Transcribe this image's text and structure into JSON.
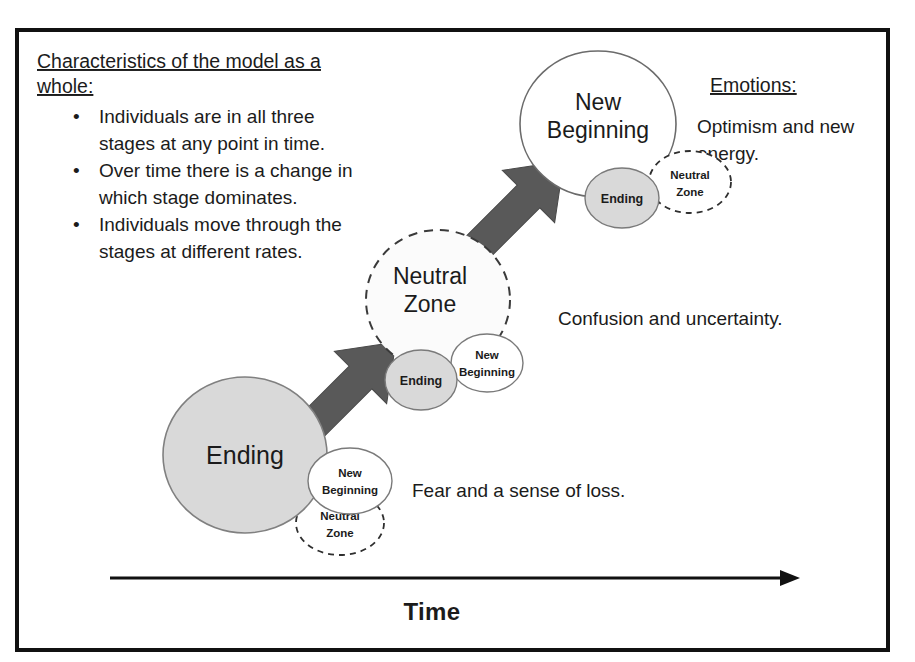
{
  "frame": {
    "border_color": "#111111",
    "background": "#ffffff"
  },
  "notes": {
    "heading_line1": "Characteristics of the model as a",
    "heading_line2": "whole:",
    "bullet_marker": "•",
    "bullets": [
      {
        "line1": "Individuals are in all three",
        "line2": "stages at any point in time."
      },
      {
        "line1": "Over time there is a change in",
        "line2": "which stage dominates."
      },
      {
        "line1": "Individuals move through the",
        "line2": "stages at different rates."
      }
    ]
  },
  "emotions": {
    "heading": "Emotions:",
    "items": [
      {
        "line1": "Optimism and new",
        "line2": "energy."
      },
      {
        "line1": "Confusion and uncertainty.",
        "line2": ""
      },
      {
        "line1": "Fear and a sense of loss.",
        "line2": ""
      }
    ]
  },
  "stages": [
    {
      "id": "stage-ending",
      "dominant": {
        "label": "Ending",
        "style": "filled-gray"
      },
      "satellites": [
        {
          "label_line1": "New",
          "label_line2": "Beginning",
          "style": "solid-white"
        },
        {
          "label_line1": "Neutral",
          "label_line2": "Zone",
          "style": "dashed-white"
        }
      ]
    },
    {
      "id": "stage-neutral-zone",
      "dominant": {
        "label_line1": "Neutral",
        "label_line2": "Zone",
        "style": "dashed-white"
      },
      "satellites": [
        {
          "label_line1": "Ending",
          "label_line2": "",
          "style": "filled-gray"
        },
        {
          "label_line1": "New",
          "label_line2": "Beginning",
          "style": "solid-white"
        }
      ]
    },
    {
      "id": "stage-new-beginning",
      "dominant": {
        "label_line1": "New",
        "label_line2": "Beginning",
        "style": "solid-white"
      },
      "satellites": [
        {
          "label_line1": "Ending",
          "label_line2": "",
          "style": "filled-gray"
        },
        {
          "label_line1": "Neutral",
          "label_line2": "Zone",
          "style": "dashed-white"
        }
      ]
    }
  ],
  "arrows": {
    "color": "#595959",
    "count": 2
  },
  "axis": {
    "label": "Time",
    "direction": "left-to-right"
  },
  "colors": {
    "fill_gray": "#d9d9d9",
    "arrow_gray": "#595959",
    "outline_dark": "#111111",
    "outline_mid": "#7a7a7a"
  }
}
